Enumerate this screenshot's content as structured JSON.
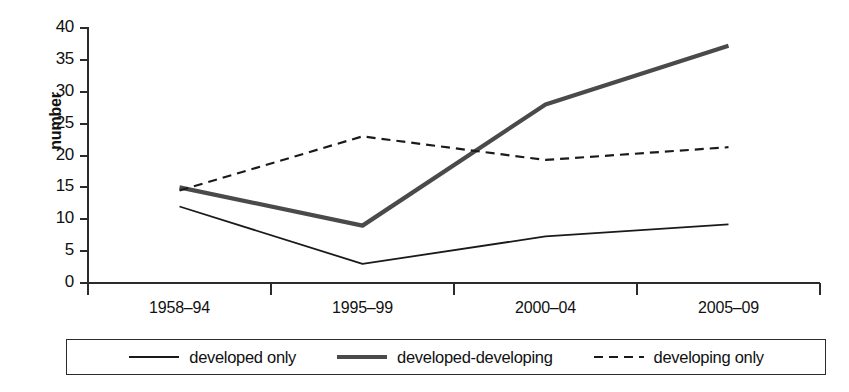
{
  "chart_data": {
    "type": "line",
    "title": "",
    "xlabel": "",
    "ylabel": "number",
    "categories": [
      "1958–94",
      "1995–99",
      "2000–04",
      "2005–09"
    ],
    "ylim": [
      0,
      40
    ],
    "yticks": [
      0,
      5,
      10,
      15,
      20,
      25,
      30,
      35,
      40
    ],
    "ytick_labels": [
      "0",
      "5",
      "10",
      "15",
      "20",
      "25",
      "30",
      "35",
      "40"
    ],
    "grid": false,
    "legend_position": "bottom",
    "series": [
      {
        "name": "developed only",
        "values": [
          12,
          3,
          7.3,
          9.2
        ],
        "style": "solid-thin",
        "color": "#1a1a1a",
        "width": 1.8,
        "dash": ""
      },
      {
        "name": "developed-developing",
        "values": [
          15,
          9,
          28,
          37.2
        ],
        "style": "solid-thick",
        "color": "#4a4a4a",
        "width": 4.2,
        "dash": ""
      },
      {
        "name": "developing only",
        "values": [
          14.5,
          23,
          19.3,
          21.3
        ],
        "style": "dashed",
        "color": "#1a1a1a",
        "width": 2.2,
        "dash": "9,6"
      }
    ]
  },
  "axis": {
    "y_label": "number",
    "axis_color": "#2b2b2b"
  },
  "legend": {
    "entries": [
      {
        "label": "developed only"
      },
      {
        "label": "developed-developing"
      },
      {
        "label": "developing only"
      }
    ]
  }
}
